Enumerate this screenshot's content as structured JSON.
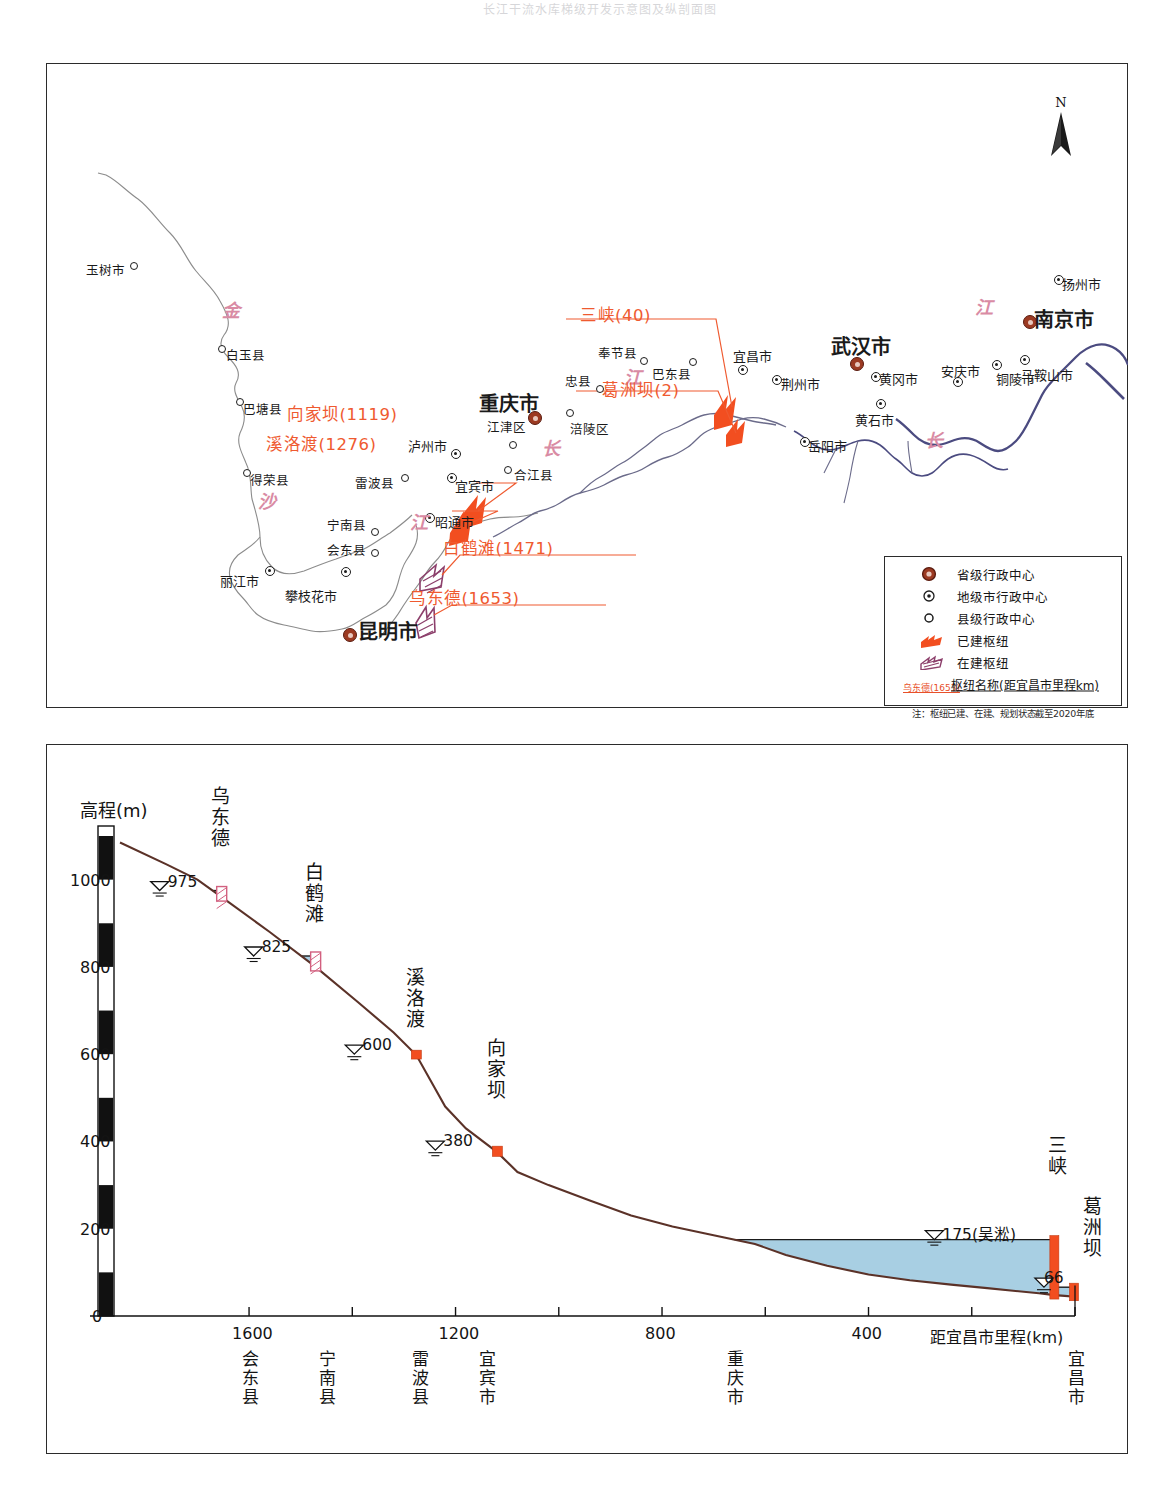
{
  "page": {
    "figure_caption_faint": "长江干流水库梯级开发示意图及纵剖面图"
  },
  "map": {
    "north_arrow_label": "N",
    "river_char_labels": [
      {
        "ch": "金",
        "x": 222,
        "y": 296
      },
      {
        "ch": "沙",
        "x": 258,
        "y": 487
      },
      {
        "ch": "江",
        "x": 410,
        "y": 508
      },
      {
        "ch": "长",
        "x": 542,
        "y": 434
      },
      {
        "ch": "江",
        "x": 624,
        "y": 363
      },
      {
        "ch": "长",
        "x": 925,
        "y": 426
      },
      {
        "ch": "江",
        "x": 975,
        "y": 293
      }
    ],
    "counties": [
      {
        "name": "玉树市",
        "x": 86,
        "y": 265,
        "sx": 130,
        "sy": 262
      },
      {
        "name": "白玉县",
        "x": 226,
        "y": 350,
        "sx": 218,
        "sy": 345
      },
      {
        "name": "巴塘县",
        "x": 243,
        "y": 404,
        "sx": 236,
        "sy": 398
      },
      {
        "name": "得荣县",
        "x": 250,
        "y": 475,
        "sx": 243,
        "sy": 469
      },
      {
        "name": "雷波县",
        "x": 355,
        "y": 478,
        "sx": 401,
        "sy": 474
      },
      {
        "name": "宁南县",
        "x": 327,
        "y": 520,
        "sx": 371,
        "sy": 528
      },
      {
        "name": "会东县",
        "x": 327,
        "y": 545,
        "sx": 371,
        "sy": 549
      },
      {
        "name": "江津区",
        "x": 487,
        "y": 422,
        "sx": 509,
        "sy": 441
      },
      {
        "name": "合江县",
        "x": 514,
        "y": 470,
        "sx": 504,
        "sy": 466
      },
      {
        "name": "涪陵区",
        "x": 570,
        "y": 424,
        "sx": 566,
        "sy": 409
      },
      {
        "name": "忠县",
        "x": 565,
        "y": 376,
        "sx": 596,
        "sy": 385
      },
      {
        "name": "奉节县",
        "x": 598,
        "y": 348,
        "sx": 640,
        "sy": 357
      },
      {
        "name": "巴东县",
        "x": 652,
        "y": 369,
        "sx": 689,
        "sy": 358
      }
    ],
    "prefectures": [
      {
        "name": "泸州市",
        "x": 408,
        "y": 440,
        "sx": 451,
        "sy": 449
      },
      {
        "name": "宜宾市",
        "x": 455,
        "y": 480,
        "sx": 447,
        "sy": 473
      },
      {
        "name": "昭通市",
        "x": 435,
        "y": 516,
        "sx": 425,
        "sy": 513
      },
      {
        "name": "丽江市",
        "x": 220,
        "y": 575,
        "sx": 265,
        "sy": 566
      },
      {
        "name": "攀枝花市",
        "x": 285,
        "y": 590,
        "sx": 341,
        "sy": 567
      },
      {
        "name": "宜昌市",
        "x": 733,
        "y": 350,
        "sx": 738,
        "sy": 365
      },
      {
        "name": "荆州市",
        "x": 781,
        "y": 378,
        "sx": 772,
        "sy": 375
      },
      {
        "name": "黄冈市",
        "x": 879,
        "y": 373,
        "sx": 871,
        "sy": 372
      },
      {
        "name": "黄石市",
        "x": 855,
        "y": 414,
        "sx": 876,
        "sy": 399
      },
      {
        "name": "岳阳市",
        "x": 808,
        "y": 440,
        "sx": 800,
        "sy": 437
      },
      {
        "name": "安庆市",
        "x": 941,
        "y": 365,
        "sx": 953,
        "sy": 377
      },
      {
        "name": "铜陵市",
        "x": 996,
        "y": 373,
        "sx": 992,
        "sy": 360
      },
      {
        "name": "马鞍山市",
        "x": 1021,
        "y": 369,
        "sx": 1020,
        "sy": 355
      },
      {
        "name": "扬州市",
        "x": 1062,
        "y": 278,
        "sx": 1054,
        "sy": 275
      }
    ],
    "provincial": [
      {
        "name": "重庆市",
        "x": 479,
        "y": 394,
        "sx": 528,
        "sy": 411
      },
      {
        "name": "武汉市",
        "x": 831,
        "y": 337,
        "sx": 850,
        "sy": 357
      },
      {
        "name": "南京市",
        "x": 1034,
        "y": 310,
        "sx": 1023,
        "sy": 315
      },
      {
        "name": "昆明市",
        "x": 358,
        "y": 622,
        "sx": 343,
        "sy": 628
      }
    ],
    "dam_callouts": [
      {
        "label": "向家坝(1119)",
        "x": 287,
        "y": 407
      },
      {
        "label": "溪洛渡(1276)",
        "x": 266,
        "y": 437
      },
      {
        "label": "白鹤滩(1471)",
        "x": 443,
        "y": 541
      },
      {
        "label": "乌东德(1653)",
        "x": 409,
        "y": 591
      },
      {
        "label": "三峡(40)",
        "x": 580,
        "y": 308
      },
      {
        "label": "葛洲坝(2)",
        "x": 602,
        "y": 383
      }
    ],
    "legend": {
      "items": [
        {
          "symbol": "provincial-center-symbol",
          "label": "省级行政中心"
        },
        {
          "symbol": "prefecture-center-symbol",
          "label": "地级市行政中心"
        },
        {
          "symbol": "county-center-symbol",
          "label": "县级行政中心"
        },
        {
          "symbol": "built-hub-symbol",
          "label": "已建枢纽"
        },
        {
          "symbol": "under-construction-hub-symbol",
          "label": "在建枢纽"
        },
        {
          "symbol": "hub-name-sample",
          "label": "枢纽名称(距宜昌市里程km)",
          "sample": "乌东德(1653)"
        }
      ],
      "note": "注：枢纽已建、在建、规划状态截至2020年底"
    }
  },
  "chart_data": {
    "type": "area",
    "ylabel": "高程(m)",
    "xlabel": "距宜昌市里程(km)",
    "ylim": [
      0,
      1100
    ],
    "xlim": [
      1850,
      0
    ],
    "yticks": [
      0,
      200,
      400,
      600,
      800,
      1000
    ],
    "xticks": [
      1600,
      1400,
      1200,
      1000,
      800,
      600,
      400,
      200,
      0
    ],
    "xticklabels": [
      "1600",
      "",
      "1200",
      "",
      "800",
      "",
      "400",
      "",
      ""
    ],
    "x_city_labels": [
      {
        "label": "会东县",
        "km": 1600
      },
      {
        "label": "宁南县",
        "km": 1450
      },
      {
        "label": "雷波县",
        "km": 1270
      },
      {
        "label": "宜宾市",
        "km": 1140
      },
      {
        "label": "重庆市",
        "km": 660
      },
      {
        "label": "宜昌市",
        "km": 0
      }
    ],
    "dams": [
      {
        "name": "乌东德",
        "km": 1653,
        "water_level": 975,
        "label": "975",
        "status": "under-construction"
      },
      {
        "name": "白鹤滩",
        "km": 1471,
        "water_level": 825,
        "label": "825",
        "status": "under-construction"
      },
      {
        "name": "溪洛渡",
        "km": 1276,
        "water_level": 600,
        "label": "600",
        "status": "built"
      },
      {
        "name": "向家坝",
        "km": 1119,
        "water_level": 380,
        "label": "380",
        "status": "built"
      },
      {
        "name": "三峡",
        "km": 40,
        "water_level": 175,
        "label": "175(吴淞)",
        "status": "built"
      },
      {
        "name": "葛洲坝",
        "km": 2,
        "water_level": 66,
        "label": "66",
        "status": "built"
      }
    ],
    "riverbed_profile": [
      {
        "km": 1850,
        "elev": 1085
      },
      {
        "km": 1760,
        "elev": 1035
      },
      {
        "km": 1700,
        "elev": 1000
      },
      {
        "km": 1653,
        "elev": 960
      },
      {
        "km": 1560,
        "elev": 880
      },
      {
        "km": 1471,
        "elev": 800
      },
      {
        "km": 1390,
        "elev": 720
      },
      {
        "km": 1320,
        "elev": 650
      },
      {
        "km": 1276,
        "elev": 598
      },
      {
        "km": 1220,
        "elev": 480
      },
      {
        "km": 1180,
        "elev": 430
      },
      {
        "km": 1119,
        "elev": 375
      },
      {
        "km": 1080,
        "elev": 330
      },
      {
        "km": 1020,
        "elev": 300
      },
      {
        "km": 940,
        "elev": 265
      },
      {
        "km": 860,
        "elev": 230
      },
      {
        "km": 780,
        "elev": 205
      },
      {
        "km": 700,
        "elev": 185
      },
      {
        "km": 620,
        "elev": 165
      },
      {
        "km": 560,
        "elev": 140
      },
      {
        "km": 480,
        "elev": 115
      },
      {
        "km": 400,
        "elev": 95
      },
      {
        "km": 320,
        "elev": 82
      },
      {
        "km": 240,
        "elev": 72
      },
      {
        "km": 170,
        "elev": 64
      },
      {
        "km": 120,
        "elev": 58
      },
      {
        "km": 70,
        "elev": 52
      },
      {
        "km": 40,
        "elev": 48
      },
      {
        "km": 20,
        "elev": 46
      },
      {
        "km": 0,
        "elev": 44
      }
    ],
    "colors": {
      "water": "#a8cfe3",
      "riverbed": "#5b3228",
      "built_dam": "#f24e20",
      "construction_dam": "#ffffff",
      "axis": "#141414"
    }
  }
}
